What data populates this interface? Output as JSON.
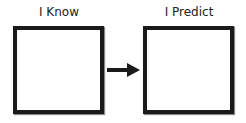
{
  "diagram": {
    "boxes": [
      {
        "label": "I Know",
        "content": ""
      },
      {
        "label": "I Predict",
        "content": ""
      }
    ],
    "arrow": {
      "from": "I Know",
      "to": "I Predict",
      "direction": "right"
    }
  }
}
